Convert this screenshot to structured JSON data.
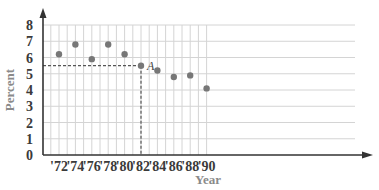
{
  "chart_data": {
    "type": "scatter",
    "title": "",
    "xlabel": "Year",
    "ylabel": "Percent",
    "categories": [
      "'72",
      "'74",
      "'76",
      "'78",
      "'80",
      "'82",
      "'84",
      "'86",
      "'88",
      "'90"
    ],
    "x": [
      1972,
      1974,
      1976,
      1978,
      1980,
      1982,
      1984,
      1986,
      1988,
      1990
    ],
    "values": [
      6.2,
      6.8,
      5.9,
      6.8,
      6.2,
      5.5,
      5.2,
      4.8,
      4.9,
      4.1
    ],
    "ylim": [
      0,
      8
    ],
    "yticks": [
      0,
      1,
      2,
      3,
      4,
      5,
      6,
      7,
      8
    ],
    "grid": true,
    "annotations": [
      {
        "label": "A",
        "x": 1982,
        "y": 5.5,
        "guides": "dashed lines to both axes"
      }
    ],
    "colors": {
      "point": "#777777",
      "grid": "#d4d4d4",
      "axis": "#333333",
      "guide": "#555555"
    }
  }
}
